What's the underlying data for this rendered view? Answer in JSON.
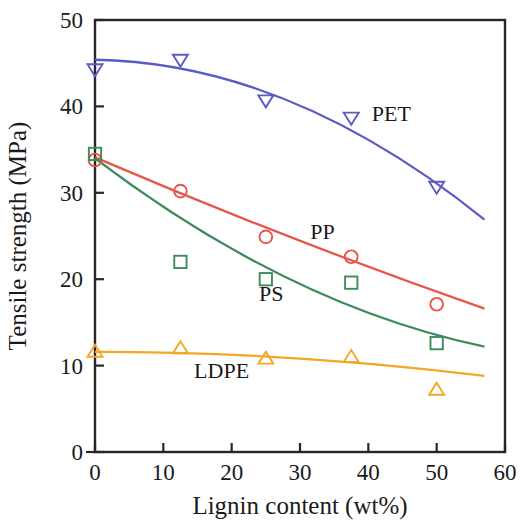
{
  "chart_data": {
    "type": "scatter",
    "title": "",
    "xlabel": "Lignin content (wt%)",
    "ylabel": "Tensile strength (MPa)",
    "xlim": [
      0,
      60
    ],
    "ylim": [
      0,
      50
    ],
    "xticks": [
      0,
      10,
      20,
      30,
      40,
      50,
      60
    ],
    "yticks": [
      0,
      10,
      20,
      30,
      40,
      50
    ],
    "xtick_labels": [
      "0",
      "10",
      "20",
      "30",
      "40",
      "50",
      "60"
    ],
    "ytick_labels": [
      "0",
      "10",
      "20",
      "30",
      "40",
      "50"
    ],
    "grid": false,
    "legend_position": "inline-annotations",
    "x": [
      0,
      12.5,
      25,
      37.5,
      50
    ],
    "series": [
      {
        "name": "PET",
        "label": "PET",
        "color": "#5b5bc4",
        "marker": "triangle-down",
        "values": [
          44.2,
          45.3,
          40.6,
          38.6,
          30.6
        ],
        "fit_start": [
          0,
          45.4
        ],
        "fit_end": [
          57,
          26.9
        ],
        "label_x": 40.5,
        "label_y": 38.3
      },
      {
        "name": "PP",
        "label": "PP",
        "color": "#e8564a",
        "marker": "circle",
        "values": [
          33.8,
          30.2,
          24.9,
          22.6,
          17.1
        ],
        "fit_start": [
          0,
          34.1
        ],
        "fit_end": [
          57,
          16.6
        ],
        "label_x": 31.5,
        "label_y": 24.6
      },
      {
        "name": "PS",
        "label": "PS",
        "color": "#3f8b5c",
        "marker": "square",
        "values": [
          34.5,
          22.0,
          20.0,
          19.6,
          12.6
        ],
        "fit_start": [
          0,
          34.0
        ],
        "fit_end": [
          57,
          12.2
        ],
        "label_x": 24.0,
        "label_y": 17.5
      },
      {
        "name": "LDPE",
        "label": "LDPE",
        "color": "#f5a623",
        "marker": "triangle-up",
        "values": [
          11.7,
          12.1,
          10.9,
          11.1,
          7.3
        ],
        "fit_start": [
          0,
          11.6
        ],
        "fit_end": [
          57,
          8.8
        ],
        "label_x": 14.5,
        "label_y": 8.6
      }
    ]
  }
}
